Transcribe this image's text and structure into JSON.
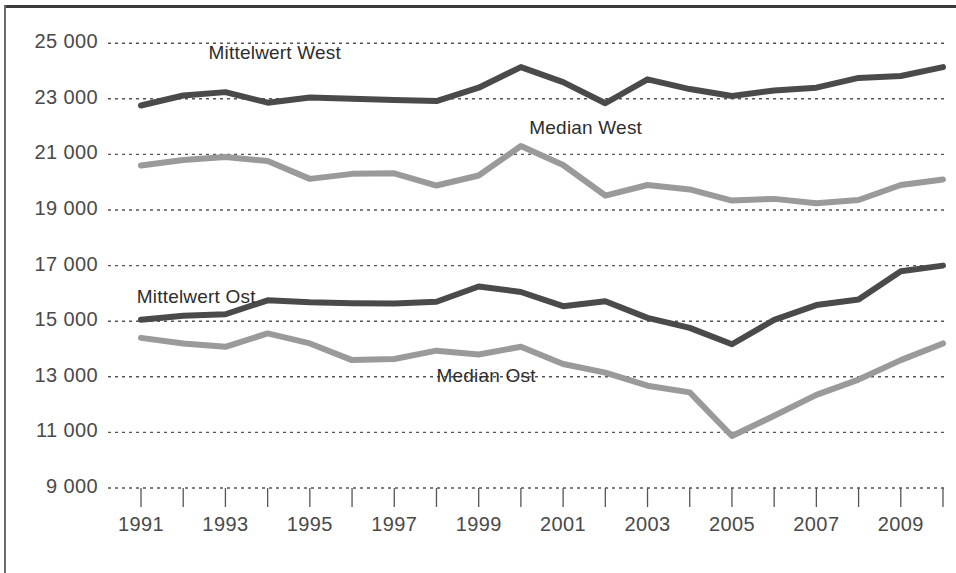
{
  "chart_data": {
    "type": "line",
    "title": "",
    "subtitle": "",
    "xlabel": "",
    "ylabel": "",
    "grid": true,
    "grid_style": "dotted-horizontal",
    "legend_position": "inline-annotations",
    "x": [
      1991,
      1992,
      1993,
      1994,
      1995,
      1996,
      1997,
      1998,
      1999,
      2000,
      2001,
      2002,
      2003,
      2004,
      2005,
      2006,
      2007,
      2008,
      2009,
      2010
    ],
    "xlim": [
      1991,
      2010
    ],
    "ylim": [
      9000,
      25800
    ],
    "ytick_values": [
      9000,
      11000,
      13000,
      15000,
      17000,
      19000,
      21000,
      23000,
      25000
    ],
    "ytick_labels": [
      "9 000",
      "11 000",
      "13 000",
      "15 000",
      "17 000",
      "19 000",
      "21 000",
      "23 000",
      "25 000"
    ],
    "xtick_values": [
      1991,
      1993,
      1995,
      1997,
      1999,
      2001,
      2003,
      2005,
      2007,
      2009
    ],
    "xtick_labels": [
      "1991",
      "1993",
      "1995",
      "1997",
      "1999",
      "2001",
      "2003",
      "2005",
      "2007",
      "2009"
    ],
    "xtick_minor_values": [
      1992,
      1994,
      1996,
      1998,
      2000,
      2002,
      2004,
      2006,
      2008,
      2010
    ],
    "series": [
      {
        "name": "Mittelwert West",
        "color": "#4a4a4a",
        "label_x": 1992.6,
        "label_y": 24600,
        "values": [
          22760,
          23120,
          23240,
          22860,
          23050,
          23000,
          22960,
          22920,
          23400,
          24140,
          23600,
          22840,
          23700,
          23350,
          23100,
          23300,
          23400,
          23750,
          23820,
          24140
        ]
      },
      {
        "name": "Median West",
        "color": "#9a9a9a",
        "label_x": 2000.2,
        "label_y": 21900,
        "values": [
          20600,
          20800,
          20910,
          20760,
          20120,
          20300,
          20320,
          19880,
          20240,
          21300,
          20620,
          19520,
          19900,
          19740,
          19340,
          19400,
          19240,
          19360,
          19900,
          20100
        ]
      },
      {
        "name": "Mittelwert Ost",
        "color": "#4a4a4a",
        "label_x": 1990.9,
        "label_y": 15850,
        "values": [
          15050,
          15200,
          15250,
          15750,
          15680,
          15650,
          15640,
          15700,
          16250,
          16050,
          15540,
          15720,
          15120,
          14760,
          14170,
          15050,
          15580,
          15780,
          16800,
          17000
        ]
      },
      {
        "name": "Median Ost",
        "color": "#9a9a9a",
        "label_x": 1998.0,
        "label_y": 13000,
        "values": [
          14400,
          14200,
          14080,
          14560,
          14200,
          13600,
          13640,
          13940,
          13800,
          14080,
          13460,
          13150,
          12680,
          12440,
          10870,
          11600,
          12350,
          12900,
          13600,
          14200
        ]
      }
    ]
  },
  "axis": {
    "ytick_labels": [
      "25 000",
      "23 000",
      "21 000",
      "19 000",
      "17 000",
      "15 000",
      "13 000",
      "11 000",
      "9 000"
    ],
    "xtick_labels": [
      "1991",
      "1993",
      "1995",
      "1997",
      "1999",
      "2001",
      "2003",
      "2005",
      "2007",
      "2009"
    ]
  },
  "annotations": [
    {
      "text": "Mittelwert West"
    },
    {
      "text": "Median West"
    },
    {
      "text": "Mittelwert Ost"
    },
    {
      "text": "Median Ost"
    }
  ],
  "colors": {
    "dark_line": "#4a4a4a",
    "light_line": "#9a9a9a",
    "grid": "#555555",
    "text": "#4a4a4a",
    "background": "#ffffff",
    "frame": "#3a3a3a"
  }
}
